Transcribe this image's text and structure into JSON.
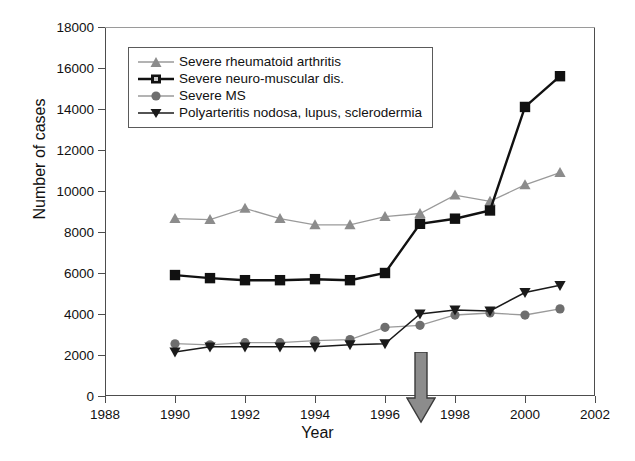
{
  "chart_data": {
    "type": "line",
    "title": "",
    "xlabel": "Year",
    "ylabel": "Number of cases",
    "xlim": [
      1988,
      2002
    ],
    "ylim": [
      0,
      18000
    ],
    "xticks": [
      1988,
      1990,
      1992,
      1994,
      1996,
      1998,
      2000,
      2002
    ],
    "yticks": [
      0,
      2000,
      4000,
      6000,
      8000,
      10000,
      12000,
      14000,
      16000,
      18000
    ],
    "grid": false,
    "legend_position": "upper-left-inside",
    "x": [
      1990,
      1991,
      1992,
      1993,
      1994,
      1995,
      1996,
      1997,
      1998,
      1999,
      2000,
      2001
    ],
    "series": [
      {
        "name": "Severe rheumatoid arthritis",
        "marker": "triangle-up",
        "color": "#8c8c8c",
        "values": [
          8650,
          8600,
          9150,
          8650,
          8350,
          8350,
          8750,
          8900,
          9800,
          9500,
          10300,
          10900
        ]
      },
      {
        "name": "Severe neuro-muscular dis.",
        "marker": "square",
        "color": "#111111",
        "values": [
          5900,
          5750,
          5650,
          5650,
          5700,
          5650,
          6000,
          8400,
          8650,
          9050,
          14100,
          15600
        ]
      },
      {
        "name": "Severe MS",
        "marker": "circle",
        "color": "#6e6e6e",
        "values": [
          2550,
          2500,
          2600,
          2600,
          2700,
          2750,
          3350,
          3450,
          3950,
          4050,
          3950,
          4250
        ]
      },
      {
        "name": "Polyarteritis nodosa, lupus, sclerodermia",
        "marker": "triangle-down",
        "color": "#1a1a1a",
        "values": [
          2150,
          2400,
          2400,
          2400,
          2400,
          2500,
          2550,
          4000,
          4200,
          4150,
          5050,
          5400
        ]
      }
    ],
    "annotations": [
      {
        "type": "arrow",
        "direction": "down",
        "x": 1995,
        "color": "#8c8c8c",
        "label": ""
      }
    ]
  },
  "axes": {
    "y_title": "Number of cases",
    "x_title": "Year",
    "y_tick_labels": [
      "18000",
      "16000",
      "14000",
      "12000",
      "10000",
      "8000",
      "6000",
      "4000",
      "2000",
      "0"
    ],
    "x_tick_labels": [
      "1988",
      "1990",
      "1992",
      "1994",
      "1996",
      "1998",
      "2000",
      "2002"
    ]
  },
  "legend": {
    "entries": [
      {
        "label": "Severe rheumatoid arthritis",
        "icon": "triangle-up-marker-icon"
      },
      {
        "label": "Severe neuro-muscular dis.",
        "icon": "square-marker-icon"
      },
      {
        "label": "Severe MS",
        "icon": "circle-marker-icon"
      },
      {
        "label": "Polyarteritis nodosa, lupus, sclerodermia",
        "icon": "triangle-down-marker-icon"
      }
    ]
  },
  "colors": {
    "arthritis": "#8c8c8c",
    "neuromuscular": "#111111",
    "ms": "#6e6e6e",
    "polyarteritis": "#1a1a1a",
    "axis": "#4d4d4d",
    "annotation_arrow": "#8c8c8c"
  }
}
